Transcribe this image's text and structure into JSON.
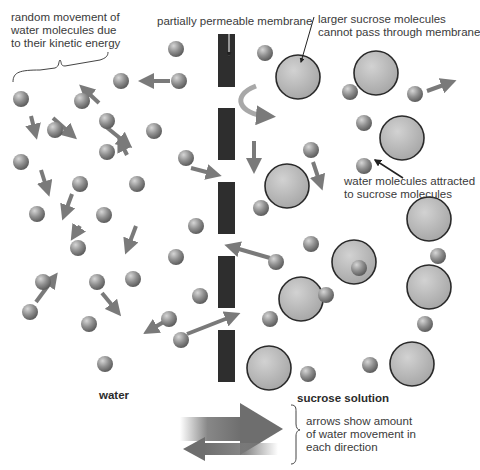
{
  "labels": {
    "random_movement": [
      "random movement of",
      "water molecules due",
      "to their kinetic energy"
    ],
    "membrane": "partially permeable membrane",
    "sucrose_large": [
      "larger sucrose molecules",
      "cannot pass through membrane"
    ],
    "attracted": [
      "water molecules attracted",
      "to sucrose molecules"
    ],
    "water": "water",
    "sucrose_solution": "sucrose solution",
    "arrows_legend": [
      "arrows show amount",
      "of water movement in",
      "each direction"
    ]
  },
  "colors": {
    "water_molecule": "#8a8a8a",
    "sucrose_fill": "#b5b5b5",
    "sucrose_outline": "#2a2a2a",
    "membrane": "#2e2e2e",
    "arrow": "#7a7a7a",
    "text": "#3a3a3a"
  },
  "membrane_segments": [
    {
      "x": 218,
      "y": 34,
      "w": 17,
      "h": 53
    },
    {
      "x": 218,
      "y": 108,
      "w": 17,
      "h": 52
    },
    {
      "x": 218,
      "y": 182,
      "w": 17,
      "h": 52
    },
    {
      "x": 218,
      "y": 256,
      "w": 17,
      "h": 52
    },
    {
      "x": 218,
      "y": 330,
      "w": 17,
      "h": 52
    }
  ],
  "water_molecules": [
    [
      176,
      49
    ],
    [
      121,
      81
    ],
    [
      179,
      81
    ],
    [
      21,
      99
    ],
    [
      82,
      101
    ],
    [
      107,
      121
    ],
    [
      55,
      130
    ],
    [
      107,
      152
    ],
    [
      154,
      131
    ],
    [
      21,
      162
    ],
    [
      186,
      158
    ],
    [
      80,
      184
    ],
    [
      137,
      184
    ],
    [
      37,
      214
    ],
    [
      196,
      226
    ],
    [
      104,
      215
    ],
    [
      78,
      248
    ],
    [
      176,
      257
    ],
    [
      43,
      282
    ],
    [
      97,
      282
    ],
    [
      133,
      279
    ],
    [
      200,
      296
    ],
    [
      30,
      312
    ],
    [
      89,
      324
    ],
    [
      169,
      319
    ],
    [
      181,
      340
    ],
    [
      105,
      364
    ],
    [
      265,
      53
    ],
    [
      350,
      92
    ],
    [
      415,
      94
    ],
    [
      364,
      123
    ],
    [
      311,
      150
    ],
    [
      364,
      166
    ],
    [
      261,
      208
    ],
    [
      311,
      244
    ],
    [
      276,
      262
    ],
    [
      438,
      256
    ],
    [
      359,
      268
    ],
    [
      326,
      295
    ],
    [
      270,
      319
    ],
    [
      425,
      324
    ],
    [
      308,
      374
    ],
    [
      370,
      365
    ]
  ],
  "sucrose_molecules": [
    [
      298,
      77
    ],
    [
      376,
      73
    ],
    [
      402,
      138
    ],
    [
      287,
      186
    ],
    [
      354,
      262
    ],
    [
      301,
      299
    ],
    [
      429,
      219
    ],
    [
      429,
      287
    ],
    [
      269,
      368
    ],
    [
      412,
      364
    ]
  ],
  "arrows": [
    [
      170,
      81,
      146,
      81
    ],
    [
      53,
      118,
      71,
      134
    ],
    [
      99,
      103,
      85,
      90
    ],
    [
      31,
      116,
      35,
      132
    ],
    [
      41,
      170,
      47,
      189
    ],
    [
      127,
      155,
      121,
      143
    ],
    [
      105,
      126,
      126,
      143
    ],
    [
      191,
      168,
      214,
      174
    ],
    [
      72,
      194,
      65,
      213
    ],
    [
      136,
      226,
      128,
      247
    ],
    [
      80,
      226,
      75,
      234
    ],
    [
      36,
      302,
      53,
      279
    ],
    [
      102,
      293,
      116,
      310
    ],
    [
      167,
      320,
      150,
      330
    ],
    [
      187,
      334,
      233,
      316
    ],
    [
      270,
      258,
      232,
      247
    ],
    [
      254,
      141,
      254,
      166
    ],
    [
      313,
      162,
      320,
      183
    ],
    [
      427,
      91,
      449,
      83
    ]
  ],
  "big_arrows": {
    "right": {
      "x1": 180,
      "x2": 283,
      "y": 429,
      "thickness": 24,
      "head": 42
    },
    "left": {
      "x1": 278,
      "x2": 183,
      "y": 449,
      "thickness": 12,
      "head": 22
    }
  }
}
